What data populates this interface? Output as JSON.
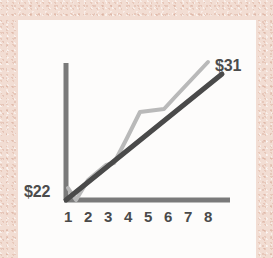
{
  "colors": {
    "page_background": "#f2ddd3",
    "card_background": "#fdfcfb",
    "axis": "#7a7a7a",
    "trend_line": "#4a4a4a",
    "data_line": "#b9b9b9",
    "text": "#4c4c4c"
  },
  "labels": {
    "start_value": "$22",
    "end_value": "$31"
  },
  "chart_data": {
    "type": "line",
    "title": "",
    "xlabel": "",
    "ylabel": "",
    "grid": false,
    "legend": null,
    "xlim": [
      1,
      8
    ],
    "ylim": [
      22,
      31
    ],
    "x": [
      1,
      2,
      3,
      4,
      5,
      6,
      7,
      8
    ],
    "categories": [
      "1",
      "2",
      "3",
      "4",
      "5",
      "6",
      "7",
      "8"
    ],
    "annotations": [
      {
        "name": "start-value",
        "text": "$22",
        "x": 1,
        "y": 22
      },
      {
        "name": "end-value",
        "text": "$31",
        "x": 8,
        "y": 31
      }
    ],
    "series": [
      {
        "name": "trend",
        "style": "solid-dark-straight",
        "color": "#4a4a4a",
        "values": [
          22,
          23.3,
          24.6,
          25.9,
          27.1,
          28.4,
          29.7,
          31
        ]
      },
      {
        "name": "actual",
        "style": "solid-light-zigzag",
        "color": "#b9b9b9",
        "values": [
          22.4,
          22,
          23.4,
          24.2,
          27.6,
          27.8,
          31.8,
          null
        ]
      }
    ]
  },
  "geometry": {
    "origin": {
      "x": 48,
      "y": 180
    },
    "x_axis_end": {
      "x": 212,
      "y": 180
    },
    "y_axis_top": {
      "x": 48,
      "y": 43
    },
    "trend_end": {
      "x": 204,
      "y": 54
    },
    "data_points": [
      {
        "x": 50,
        "y": 168
      },
      {
        "x": 58,
        "y": 180
      },
      {
        "x": 70,
        "y": 160
      },
      {
        "x": 88,
        "y": 145
      },
      {
        "x": 96,
        "y": 143
      },
      {
        "x": 108,
        "y": 120
      },
      {
        "x": 122,
        "y": 92
      },
      {
        "x": 146,
        "y": 89
      },
      {
        "x": 158,
        "y": 76
      },
      {
        "x": 190,
        "y": 42
      }
    ]
  }
}
